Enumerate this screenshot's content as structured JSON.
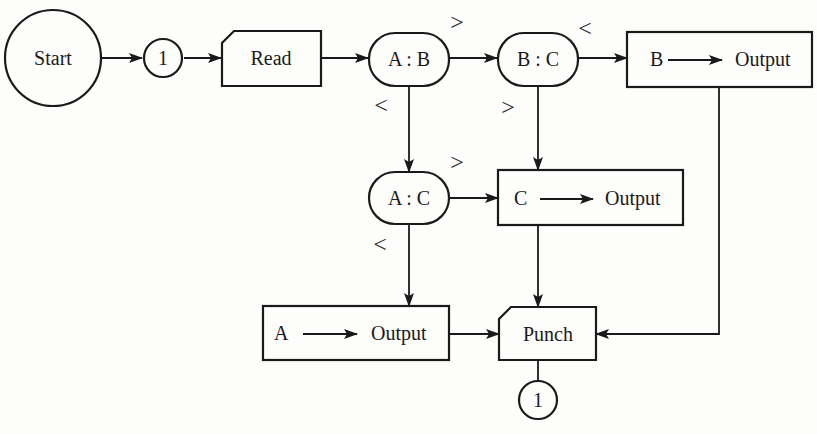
{
  "diagram": {
    "type": "flowchart",
    "nodes": {
      "start": {
        "label": "Start",
        "shape": "circle"
      },
      "connector_top": {
        "label": "1",
        "shape": "connector"
      },
      "read": {
        "label": "Read",
        "shape": "card"
      },
      "compare_ab": {
        "label": "A : B",
        "shape": "decision-pill"
      },
      "compare_bc": {
        "label": "B : C",
        "shape": "decision-pill"
      },
      "compare_ac": {
        "label": "A : C",
        "shape": "decision-pill"
      },
      "output_b": {
        "var": "B",
        "label": "Output",
        "shape": "process"
      },
      "output_c": {
        "var": "C",
        "label": "Output",
        "shape": "process"
      },
      "output_a": {
        "var": "A",
        "label": "Output",
        "shape": "process"
      },
      "punch": {
        "label": "Punch",
        "shape": "card"
      },
      "connector_bottom": {
        "label": "1",
        "shape": "connector"
      }
    },
    "branch_labels": {
      "ab_gt": ">",
      "ab_lt": "<",
      "bc_lt": "<",
      "bc_gt": ">",
      "ac_gt": ">",
      "ac_lt": "<"
    },
    "edges": [
      {
        "from": "Start",
        "to": "1"
      },
      {
        "from": "1",
        "to": "Read"
      },
      {
        "from": "Read",
        "to": "A : B"
      },
      {
        "from": "A : B",
        "to": "B : C",
        "condition": ">"
      },
      {
        "from": "A : B",
        "to": "A : C",
        "condition": "<"
      },
      {
        "from": "B : C",
        "to": "B → Output",
        "condition": "<"
      },
      {
        "from": "B : C",
        "to": "C → Output",
        "condition": ">"
      },
      {
        "from": "A : C",
        "to": "C → Output",
        "condition": ">"
      },
      {
        "from": "A : C",
        "to": "A → Output",
        "condition": "<"
      },
      {
        "from": "A → Output",
        "to": "Punch"
      },
      {
        "from": "C → Output",
        "to": "Punch"
      },
      {
        "from": "B → Output",
        "to": "Punch"
      },
      {
        "from": "Punch",
        "to": "1"
      }
    ]
  }
}
